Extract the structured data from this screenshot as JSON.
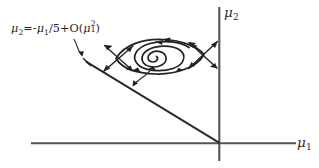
{
  "figure": {
    "kind": "hand-drawn-phase-portrait",
    "background_color": "#ffffff",
    "ink_color": "#262626",
    "axis_color": "#545454",
    "width_px": 319,
    "height_px": 168
  },
  "axes": {
    "vertical": {
      "label_mu": "μ",
      "label_subscript": "2",
      "x_px": 219,
      "y_top_px": 8,
      "y_bottom_px": 160
    },
    "horizontal": {
      "label_mu": "μ",
      "label_subscript": "1",
      "y_px": 143,
      "x_left_px": 32,
      "x_right_px": 295
    },
    "origin": {
      "x_px": 219,
      "y_px": 143
    }
  },
  "annotation": {
    "formula_plain": "μ2 = -μ1 /5 + O(μ1^2)",
    "tokens": {
      "mu_a": "μ",
      "sub_2": "2",
      "equals": "=",
      "minus": "-",
      "mu_b": "μ",
      "sub_1": "1",
      "over_five": "/5",
      "plus": "+",
      "big_o": "O(",
      "mu_c": "μ",
      "sub_1b": "1",
      "sup_2": "2",
      "close_paren": ")"
    },
    "leader_target": "bifurcation-line-endpoint"
  },
  "curves": {
    "bifurcation_line": {
      "name": "straight bifurcation line through origin",
      "from_px": [
        86,
        62
      ],
      "to_px": [
        219,
        143
      ]
    },
    "limit_cycle": {
      "name": "lens-shaped closed orbit",
      "center_px": [
        160,
        57
      ],
      "half_width_px": 45,
      "half_height_px": 16,
      "flow_direction": "counterclockwise",
      "arrow_count": 4
    },
    "inner_spiral": {
      "name": "inward counterclockwise spiral",
      "center_px": [
        152,
        57
      ],
      "turns": 2.4,
      "flow_direction": "counterclockwise-inward"
    },
    "crossing_arrows_left": {
      "center_px": [
        118,
        58
      ],
      "pairs": 2
    },
    "crossing_arrows_right": {
      "center_px": [
        203,
        55
      ],
      "pairs": 2
    },
    "leader_lower": {
      "from_px": [
        150,
        70
      ],
      "to_px": [
        132,
        88
      ]
    }
  }
}
